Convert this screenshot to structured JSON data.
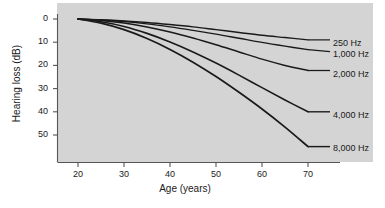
{
  "chart_data": {
    "type": "line",
    "title": "",
    "xlabel": "Age (years)",
    "ylabel": "Hearing loss (dB)",
    "xlim": [
      20,
      70
    ],
    "ylim": [
      0,
      57
    ],
    "y_axis_inverted": true,
    "grid": false,
    "legend_position": "right-of-curve-ends",
    "xticks": [
      20,
      30,
      40,
      50,
      60,
      70
    ],
    "xtick_labels": [
      "20",
      "30",
      "40",
      "50",
      "60",
      "70"
    ],
    "yticks": [
      0,
      10,
      20,
      30,
      40,
      50
    ],
    "ytick_labels": [
      "0",
      "10",
      "20",
      "30",
      "40",
      "50"
    ],
    "x": [
      20,
      25,
      30,
      35,
      40,
      45,
      50,
      55,
      60,
      65,
      70
    ],
    "series": [
      {
        "name": "250 Hz",
        "label": "250 Hz",
        "color": "#1a1a1a",
        "values": [
          0,
          0.3,
          0.8,
          1.5,
          2.4,
          3.4,
          4.6,
          5.8,
          7.0,
          8.0,
          9.0
        ]
      },
      {
        "name": "1,000 Hz",
        "label": "1,000 Hz",
        "color": "#1a1a1a",
        "values": [
          0,
          0.4,
          1.1,
          2.1,
          3.4,
          4.9,
          6.5,
          8.3,
          10.1,
          11.7,
          13.2
        ]
      },
      {
        "name": "2,000 Hz",
        "label": "2,000 Hz",
        "color": "#1a1a1a",
        "values": [
          0,
          0.6,
          1.7,
          3.4,
          5.6,
          8.2,
          11.1,
          14.2,
          17.3,
          20.0,
          22.2
        ]
      },
      {
        "name": "4,000 Hz",
        "label": "4,000 Hz",
        "color": "#1a1a1a",
        "values": [
          0,
          1.2,
          3.2,
          6.2,
          9.9,
          14.2,
          19.0,
          24.2,
          29.6,
          34.9,
          40.0
        ]
      },
      {
        "name": "8,000 Hz",
        "label": "8,000 Hz",
        "color": "#1a1a1a",
        "values": [
          0,
          1.8,
          4.6,
          8.4,
          13.1,
          18.6,
          24.8,
          31.6,
          38.8,
          46.6,
          55.0
        ]
      }
    ],
    "axis_color": "#555555",
    "panel_background": "#d4d4d4",
    "figure_background": "#ffffff"
  }
}
